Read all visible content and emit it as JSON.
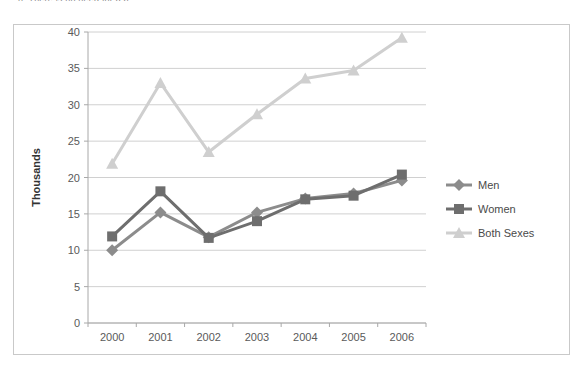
{
  "title_partial": "n. There is no need for a p",
  "chart_data": {
    "type": "line",
    "title": "",
    "xlabel": "",
    "ylabel": "Thousands",
    "categories": [
      "2000",
      "2001",
      "2002",
      "2003",
      "2004",
      "2005",
      "2006"
    ],
    "ylim": [
      0,
      40
    ],
    "yticks": [
      0,
      5,
      10,
      15,
      20,
      25,
      30,
      35,
      40
    ],
    "grid": true,
    "legend_position": "right",
    "series": [
      {
        "name": "Men",
        "color": "#8c8c8c",
        "marker": "diamond",
        "values": [
          10.0,
          15.2,
          11.8,
          15.2,
          17.1,
          17.8,
          19.6
        ]
      },
      {
        "name": "Women",
        "color": "#6e6e6e",
        "marker": "square",
        "values": [
          11.9,
          18.1,
          11.7,
          14.0,
          17.0,
          17.5,
          20.4
        ]
      },
      {
        "name": "Both Sexes",
        "color": "#cfcfcf",
        "marker": "triangle",
        "values": [
          21.9,
          33.0,
          23.5,
          28.7,
          33.6,
          34.7,
          39.2
        ]
      }
    ]
  }
}
